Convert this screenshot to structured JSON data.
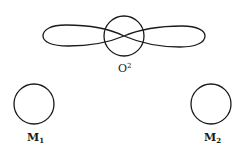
{
  "diagram": {
    "stroke_color": "#1a1a1a",
    "background": "#ffffff",
    "center_atom": {
      "label": "O",
      "superscript": "2",
      "circle": {
        "cx": 124,
        "cy": 36,
        "r": 20
      },
      "orbital": "p-orbital figure-eight lobes"
    },
    "left_atom": {
      "label": "M",
      "subscript": "1",
      "circle": {
        "cx": 34,
        "cy": 104,
        "r": 20
      }
    },
    "right_atom": {
      "label": "M",
      "subscript": "2",
      "circle": {
        "cx": 211,
        "cy": 104,
        "r": 20
      }
    }
  }
}
